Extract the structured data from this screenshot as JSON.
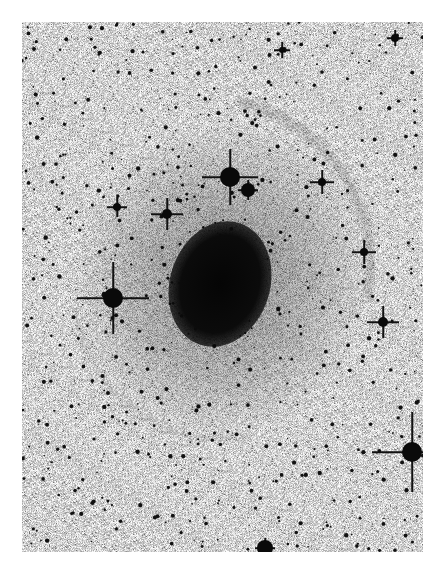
{
  "image": {
    "description": "Inverted (negative) astronomical photograph of an elliptical galaxy with faint outer shells, surrounded by a dense star field",
    "palette": {
      "background": "#ffffff",
      "sky": "#d4d4d4",
      "objects": "#0a0a0a"
    },
    "frame": {
      "x": 22,
      "y": 22,
      "width": 401,
      "height": 530
    },
    "galaxy": {
      "cx": 198,
      "cy": 262,
      "rx": 50,
      "ry": 64,
      "rotation_deg": 18
    },
    "bright_stars": [
      {
        "x": 91,
        "y": 276,
        "r": 10,
        "spikes": 36
      },
      {
        "x": 208,
        "y": 155,
        "r": 10,
        "spikes": 28
      },
      {
        "x": 390,
        "y": 430,
        "r": 10,
        "spikes": 40
      },
      {
        "x": 361,
        "y": 300,
        "r": 5,
        "spikes": 16
      },
      {
        "x": 145,
        "y": 192,
        "r": 5,
        "spikes": 16
      },
      {
        "x": 95,
        "y": 185,
        "r": 4,
        "spikes": 10
      },
      {
        "x": 300,
        "y": 160,
        "r": 4,
        "spikes": 12
      },
      {
        "x": 342,
        "y": 230,
        "r": 4,
        "spikes": 12
      },
      {
        "x": 226,
        "y": 168,
        "r": 7,
        "spikes": 10
      },
      {
        "x": 243,
        "y": 526,
        "r": 8,
        "spikes": 10
      },
      {
        "x": 373,
        "y": 16,
        "r": 4,
        "spikes": 8
      },
      {
        "x": 260,
        "y": 28,
        "r": 3,
        "spikes": 8
      }
    ],
    "faint_star_count": 650
  }
}
